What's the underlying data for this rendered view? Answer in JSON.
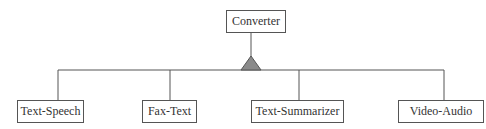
{
  "diagram": {
    "type": "generalization-hierarchy",
    "parent": {
      "label": "Converter"
    },
    "connector": {
      "symbol": "inheritance-triangle",
      "fill": "#8a8a8a",
      "stroke": "#555555"
    },
    "children": [
      {
        "label": "Text-Speech"
      },
      {
        "label": "Fax-Text"
      },
      {
        "label": "Text-Summarizer"
      },
      {
        "label": "Video-Audio"
      }
    ],
    "colors": {
      "line": "#555555",
      "text": "#333333",
      "background": "#ffffff"
    }
  }
}
